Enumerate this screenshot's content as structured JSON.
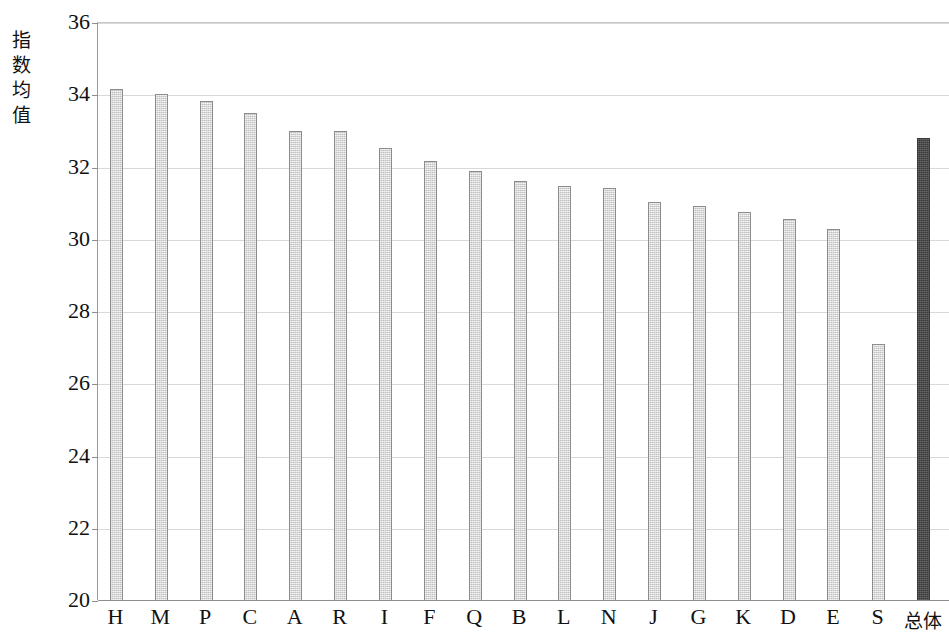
{
  "chart_data": {
    "type": "bar",
    "title": "",
    "subtitle": "",
    "xlabel": "",
    "ylabel": "指数均值",
    "ylabel_chars": [
      "指",
      "数",
      "均",
      "值"
    ],
    "ylim": [
      20,
      36
    ],
    "ytick_step": 2,
    "yticks": [
      20,
      22,
      24,
      26,
      28,
      30,
      32,
      34,
      36
    ],
    "ytick_labels": [
      "20",
      "22",
      "24",
      "26",
      "28",
      "30",
      "32",
      "34",
      "36"
    ],
    "grid": true,
    "grid_axis": "y",
    "legend": false,
    "legend_position": "none",
    "categories": [
      "H",
      "M",
      "P",
      "C",
      "A",
      "R",
      "I",
      "F",
      "Q",
      "B",
      "L",
      "N",
      "J",
      "G",
      "K",
      "D",
      "E",
      "S",
      "总体"
    ],
    "values": [
      34.15,
      34.02,
      33.82,
      33.47,
      32.97,
      32.97,
      32.5,
      32.15,
      31.88,
      31.6,
      31.45,
      31.4,
      31.02,
      30.9,
      30.75,
      30.55,
      30.28,
      27.1,
      32.8
    ],
    "bars": [
      {
        "label": "H",
        "value": 34.15,
        "style": "light"
      },
      {
        "label": "M",
        "value": 34.02,
        "style": "light"
      },
      {
        "label": "P",
        "value": 33.82,
        "style": "light"
      },
      {
        "label": "C",
        "value": 33.47,
        "style": "light"
      },
      {
        "label": "A",
        "value": 32.97,
        "style": "light"
      },
      {
        "label": "R",
        "value": 32.97,
        "style": "light"
      },
      {
        "label": "I",
        "value": 32.5,
        "style": "light"
      },
      {
        "label": "F",
        "value": 32.15,
        "style": "light"
      },
      {
        "label": "Q",
        "value": 31.88,
        "style": "light"
      },
      {
        "label": "B",
        "value": 31.6,
        "style": "light"
      },
      {
        "label": "L",
        "value": 31.45,
        "style": "light"
      },
      {
        "label": "N",
        "value": 31.4,
        "style": "light"
      },
      {
        "label": "J",
        "value": 31.02,
        "style": "light"
      },
      {
        "label": "G",
        "value": 30.9,
        "style": "light"
      },
      {
        "label": "K",
        "value": 30.75,
        "style": "light"
      },
      {
        "label": "D",
        "value": 30.55,
        "style": "light"
      },
      {
        "label": "E",
        "value": 30.28,
        "style": "light"
      },
      {
        "label": "S",
        "value": 27.1,
        "style": "light"
      },
      {
        "label": "总体",
        "value": 32.8,
        "style": "dark"
      }
    ],
    "colors": {
      "bar_light_fill": "#d2d2d2",
      "bar_light_edge": "#8c8c8c",
      "bar_dark_fill": "#474747",
      "bar_dark_edge": "#3a3a3a",
      "gridline": "#d8d8d8",
      "axis": "#8e8e8e",
      "text": "#111111",
      "background": "#ffffff"
    }
  }
}
